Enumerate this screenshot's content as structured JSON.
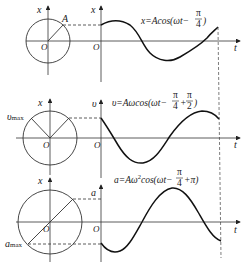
{
  "panels": [
    {
      "id": "displacement",
      "vertical_axis_circle": "x",
      "vertical_axis_graph": "x",
      "origin_circle": "O",
      "origin_graph": "O",
      "time_axis": "t",
      "point_label": "A",
      "equation": {
        "lhs": "x=Acos(ωt−",
        "frac_num": "π",
        "frac_den": "4",
        "rhs": ")"
      }
    },
    {
      "id": "velocity",
      "vertical_axis_circle": "x",
      "vertical_axis_graph": "υ",
      "origin_circle": "O",
      "origin_graph": "O",
      "time_axis": "t",
      "point_label": "υ",
      "point_sub": "max",
      "equation": {
        "lhs": "υ=Aωcos(ωt−",
        "frac_num": "π",
        "frac_den": "4",
        "mid": "+",
        "frac2_num": "π",
        "frac2_den": "2",
        "rhs": ")"
      }
    },
    {
      "id": "acceleration",
      "vertical_axis_circle": "x",
      "vertical_axis_graph": "a",
      "origin_circle": "O",
      "origin_graph": "O",
      "time_axis": "t",
      "point_label": "a",
      "point_sub": "max",
      "equation": {
        "lhs": "a=Aω",
        "sup": "2",
        "lhs2": "cos(ωt−",
        "frac_num": "π",
        "frac_den": "4",
        "rhs": "+π)"
      }
    }
  ]
}
